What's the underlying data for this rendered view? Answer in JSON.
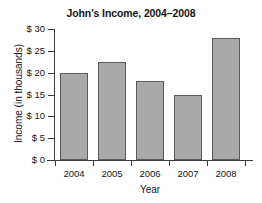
{
  "chart_data": {
    "type": "bar",
    "title": "John's Income, 2004–2008",
    "xlabel": "Year",
    "ylabel": "Income (in thousands)",
    "categories": [
      "2004",
      "2005",
      "2006",
      "2007",
      "2008"
    ],
    "values": [
      20,
      22.5,
      18,
      15,
      28
    ],
    "ylim": [
      0,
      30
    ],
    "ytick_values": [
      0,
      5,
      10,
      15,
      20,
      25,
      30
    ],
    "ytick_labels": [
      "$ 0",
      "$ 5",
      "$ 10",
      "$ 15",
      "$ 20",
      "$ 25",
      "$ 30"
    ],
    "grid": false,
    "legend": null,
    "series": [
      {
        "name": "Income",
        "values": [
          20,
          22.5,
          18,
          15,
          28
        ]
      }
    ],
    "units": "thousands of dollars",
    "bar_color": "#a9a9a9",
    "bar_edge_color": "#5a5a5a",
    "axis_color": "#3d3d3d",
    "background_color": "#ffffff"
  }
}
